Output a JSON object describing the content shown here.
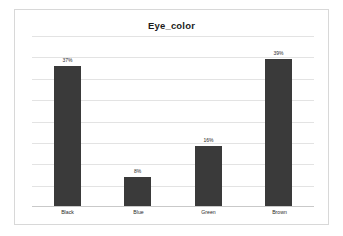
{
  "chart_data": {
    "type": "bar",
    "title": "Eye_color",
    "xlabel": "",
    "ylabel": "",
    "categories": [
      "Black",
      "Blue",
      "Green",
      "Brown"
    ],
    "values": [
      37,
      8,
      16,
      39
    ],
    "value_labels": [
      "37%",
      "8%",
      "16%",
      "39%"
    ],
    "ylim": [
      0,
      45
    ],
    "grid": true,
    "gridline_count": 8,
    "legend": "none",
    "series": [
      {
        "name": "Eye_color",
        "values": [
          37,
          8,
          16,
          39
        ]
      }
    ],
    "colors": {
      "bar": "#3a3a3a",
      "gridline": "#e3e3e3",
      "axis": "#c9c9c9",
      "border": "#d8d8d8",
      "background": "#ffffff",
      "text": "#2b2b2b",
      "title": "#1c1c1c"
    }
  }
}
